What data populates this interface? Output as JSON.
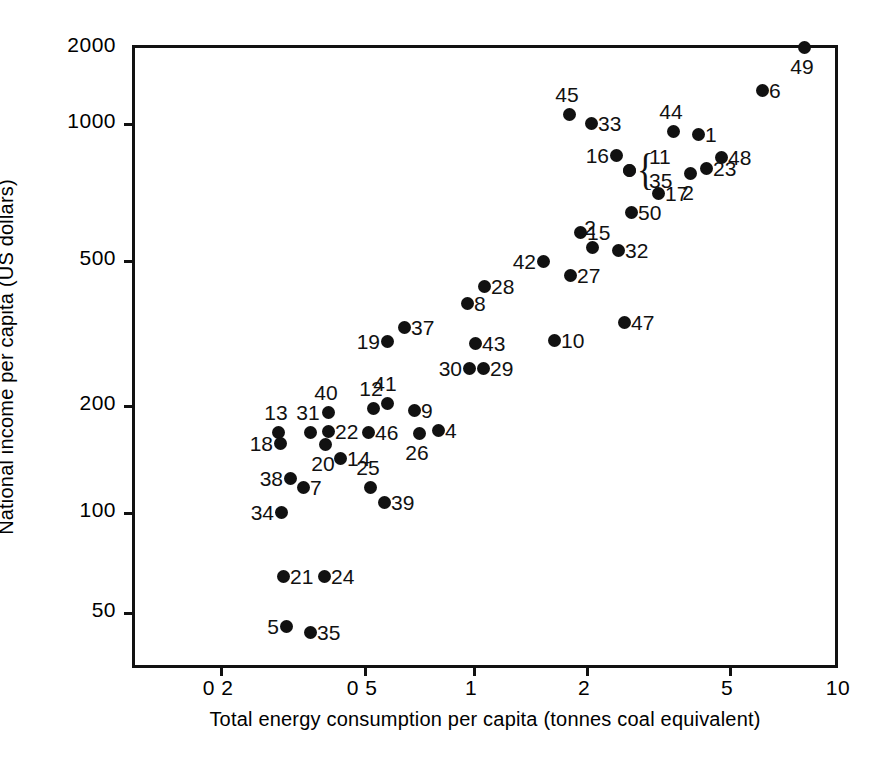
{
  "chart_data": {
    "type": "scatter",
    "title": "",
    "xlabel": "Total energy consumption per capita (tonnes coal equivalent)",
    "ylabel": "National income per capita  (US dollars)",
    "xscale": "log",
    "yscale": "log",
    "xlim": [
      0.125,
      10
    ],
    "ylim": [
      40,
      2000
    ],
    "xticks": [
      "0 2",
      "0 5",
      "1",
      "2",
      "5",
      "10"
    ],
    "xtick_values": [
      0.2,
      0.5,
      1,
      2,
      5,
      10
    ],
    "yticks": [
      "2000",
      "1000",
      "500",
      "200",
      "100",
      "50"
    ],
    "ytick_values": [
      2000,
      1000,
      500,
      200,
      100,
      50
    ],
    "grid": false,
    "legend": false,
    "marker": "filled-circle",
    "marker_color": "#111111",
    "point_label_note": "Each point is annotated with its country index number",
    "points": [
      {
        "label": "49",
        "x": 8.0,
        "y": 1980,
        "px": 804,
        "py": 47,
        "lpos": "b"
      },
      {
        "label": "6",
        "x": 6.2,
        "y": 1500,
        "px": 762,
        "py": 90,
        "lpos": "r"
      },
      {
        "label": "45",
        "x": 1.85,
        "y": 1300,
        "px": 569,
        "py": 114,
        "lpos": "t"
      },
      {
        "label": "33",
        "x": 2.05,
        "y": 1220,
        "px": 591,
        "py": 123,
        "lpos": "r"
      },
      {
        "label": "44",
        "x": 3.35,
        "y": 1140,
        "px": 673,
        "py": 131,
        "lpos": "t"
      },
      {
        "label": "1",
        "x": 3.65,
        "y": 1120,
        "px": 698,
        "py": 134,
        "lpos": "r"
      },
      {
        "label": "16",
        "x": 2.45,
        "y": 980,
        "px": 616,
        "py": 155,
        "lpos": "l"
      },
      {
        "label": "48",
        "x": 4.45,
        "y": 960,
        "px": 721,
        "py": 157,
        "lpos": "r"
      },
      {
        "label": "11",
        "x": 2.62,
        "y": 890,
        "px": 629,
        "py": 170,
        "lpos": "brace"
      },
      {
        "label": "35",
        "x": 2.62,
        "y": 890,
        "px": 629,
        "py": 170,
        "lpos": "brace"
      },
      {
        "label": "23",
        "x": 4.05,
        "y": 900,
        "px": 706,
        "py": 168,
        "lpos": "r"
      },
      {
        "label": "2",
        "x": 3.75,
        "y": 870,
        "px": 690,
        "py": 173,
        "lpos": "b"
      },
      {
        "label": "17",
        "x": 3.05,
        "y": 770,
        "px": 658,
        "py": 193,
        "lpos": "r"
      },
      {
        "label": "50",
        "x": 2.65,
        "y": 680,
        "px": 631,
        "py": 212,
        "lpos": "r"
      },
      {
        "label": "15",
        "x": 1.95,
        "y": 610,
        "px": 580,
        "py": 232,
        "lpos": "r"
      },
      {
        "label": "2",
        "x": 2.28,
        "y": 560,
        "px": 592,
        "py": 247,
        "lpos": "t"
      },
      {
        "label": "32",
        "x": 2.55,
        "y": 545,
        "px": 618,
        "py": 250,
        "lpos": "r"
      },
      {
        "label": "42",
        "x": 1.62,
        "y": 490,
        "px": 543,
        "py": 261,
        "lpos": "l"
      },
      {
        "label": "27",
        "x": 2.05,
        "y": 455,
        "px": 570,
        "py": 275,
        "lpos": "r"
      },
      {
        "label": "28",
        "x": 1.13,
        "y": 415,
        "px": 484,
        "py": 286,
        "lpos": "r"
      },
      {
        "label": "8",
        "x": 1.02,
        "y": 380,
        "px": 467,
        "py": 303,
        "lpos": "r"
      },
      {
        "label": "47",
        "x": 2.55,
        "y": 345,
        "px": 624,
        "py": 322,
        "lpos": "r"
      },
      {
        "label": "37",
        "x": 0.69,
        "y": 310,
        "px": 404,
        "py": 327,
        "lpos": "r"
      },
      {
        "label": "10",
        "x": 1.68,
        "y": 285,
        "px": 554,
        "py": 340,
        "lpos": "r"
      },
      {
        "label": "19",
        "x": 0.61,
        "y": 278,
        "px": 387,
        "py": 341,
        "lpos": "l"
      },
      {
        "label": "43",
        "x": 1.05,
        "y": 272,
        "px": 475,
        "py": 343,
        "lpos": "r"
      },
      {
        "label": "30",
        "x": 1.0,
        "y": 252,
        "px": 469,
        "py": 368,
        "lpos": "l"
      },
      {
        "label": "29",
        "x": 1.08,
        "y": 252,
        "px": 483,
        "py": 368,
        "lpos": "r"
      },
      {
        "label": "41",
        "x": 0.6,
        "y": 205,
        "px": 387,
        "py": 403,
        "lpos": "t"
      },
      {
        "label": "12",
        "x": 0.555,
        "y": 198,
        "px": 373,
        "py": 408,
        "lpos": "t"
      },
      {
        "label": "9",
        "x": 0.69,
        "y": 195,
        "px": 414,
        "py": 410,
        "lpos": "r"
      },
      {
        "label": "40",
        "x": 0.405,
        "y": 193,
        "px": 328,
        "py": 412,
        "lpos": "t"
      },
      {
        "label": "13",
        "x": 0.285,
        "y": 168,
        "px": 278,
        "py": 432,
        "lpos": "t"
      },
      {
        "label": "31",
        "x": 0.365,
        "y": 168,
        "px": 310,
        "py": 432,
        "lpos": "t"
      },
      {
        "label": "22",
        "x": 0.405,
        "y": 169,
        "px": 328,
        "py": 431,
        "lpos": "r"
      },
      {
        "label": "46",
        "x": 0.53,
        "y": 168,
        "px": 368,
        "py": 432,
        "lpos": "r"
      },
      {
        "label": "4",
        "x": 0.78,
        "y": 170,
        "px": 438,
        "py": 430,
        "lpos": "r"
      },
      {
        "label": "18",
        "x": 0.29,
        "y": 160,
        "px": 280,
        "py": 443,
        "lpos": "l"
      },
      {
        "label": "20",
        "x": 0.4,
        "y": 159,
        "px": 325,
        "py": 444,
        "lpos": "b"
      },
      {
        "label": "26",
        "x": 0.715,
        "y": 167,
        "px": 419,
        "py": 433,
        "lpos": "b"
      },
      {
        "label": "14",
        "x": 0.455,
        "y": 148,
        "px": 340,
        "py": 458,
        "lpos": "r"
      },
      {
        "label": "38",
        "x": 0.315,
        "y": 128,
        "px": 290,
        "py": 478,
        "lpos": "l"
      },
      {
        "label": "7",
        "x": 0.345,
        "y": 120,
        "px": 303,
        "py": 487,
        "lpos": "r"
      },
      {
        "label": "25",
        "x": 0.565,
        "y": 120,
        "px": 370,
        "py": 487,
        "lpos": "t"
      },
      {
        "label": "39",
        "x": 0.6,
        "y": 108,
        "px": 384,
        "py": 502,
        "lpos": "r"
      },
      {
        "label": "34",
        "x": 0.29,
        "y": 100,
        "px": 281,
        "py": 512,
        "lpos": "l"
      },
      {
        "label": "21",
        "x": 0.295,
        "y": 69,
        "px": 283,
        "py": 576,
        "lpos": "r"
      },
      {
        "label": "24",
        "x": 0.395,
        "y": 69,
        "px": 324,
        "py": 576,
        "lpos": "r"
      },
      {
        "label": "5",
        "x": 0.3,
        "y": 47,
        "px": 286,
        "py": 626,
        "lpos": "l"
      },
      {
        "label": "35",
        "x": 0.365,
        "y": 45,
        "px": 310,
        "py": 632,
        "lpos": "r"
      }
    ]
  },
  "axes": {
    "y_title": "National income per capita  (US dollars)",
    "x_title": "Total energy consumption per capita (tonnes coal equivalent)",
    "y_ticks": [
      {
        "text": "2000",
        "py": 45
      },
      {
        "text": "1000",
        "py": 121
      },
      {
        "text": "500",
        "py": 258
      },
      {
        "text": "200",
        "py": 403
      },
      {
        "text": "100",
        "py": 510
      },
      {
        "text": "50",
        "py": 610
      }
    ],
    "x_ticks": [
      {
        "text": "0 2",
        "px": 218
      },
      {
        "text": "0 5",
        "px": 362
      },
      {
        "text": "1",
        "px": 471
      },
      {
        "text": "2",
        "px": 584
      },
      {
        "text": "5",
        "px": 727
      },
      {
        "text": "10",
        "px": 838
      }
    ]
  },
  "brace": {
    "glyph": "{"
  }
}
